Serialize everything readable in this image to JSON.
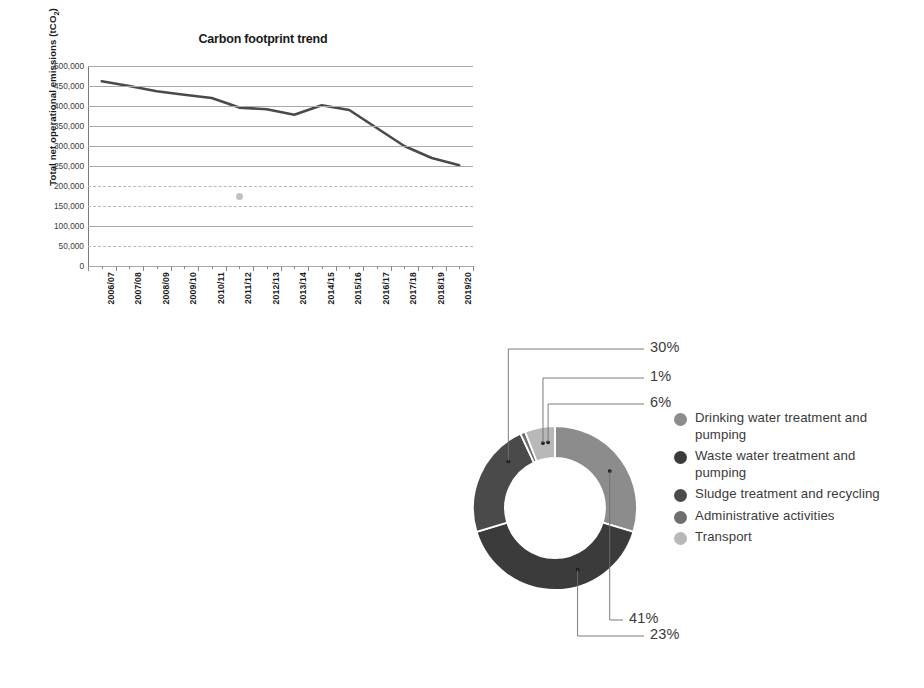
{
  "chart_data": [
    {
      "type": "line",
      "title": "Carbon footprint trend",
      "xlabel": "",
      "ylabel": "Total net operational emissions (tCO2)",
      "ylabel_main": "Total  net operational  emissions (tCO",
      "ylabel_sub": "2",
      "ylabel_tail": ")",
      "categories": [
        "2006/07",
        "2007/08",
        "2008/09",
        "2009/10",
        "2010/11",
        "2011/12",
        "2012/13",
        "2013/14",
        "2014/15",
        "2015/16",
        "2016/17",
        "2017/18",
        "2018/19",
        "2019/20"
      ],
      "values": [
        462000,
        450000,
        437000,
        428000,
        420000,
        396000,
        392000,
        378000,
        402000,
        390000,
        345000,
        300000,
        270000,
        252000
      ],
      "ylim": [
        0,
        500000
      ],
      "ytick_values": [
        500000,
        450000,
        400000,
        350000,
        300000,
        250000,
        200000,
        150000,
        100000,
        50000,
        0
      ],
      "ytick_labels": [
        "500,000",
        "450,000",
        "400,000",
        "350,000",
        "300,000",
        "250,000",
        "200,000",
        "150,000",
        "100,000",
        "50,000",
        "0"
      ],
      "grid": true,
      "legend": "none",
      "series_color": "#4a4a4a",
      "annotation": "small gray smudge artifact near 2011/12 at about 175,000"
    },
    {
      "type": "pie",
      "variant": "donut",
      "title": "",
      "labels": [
        "Drinking water treatment and pumping",
        "Waste water treatment and pumping",
        "Sludge treatment and recycling",
        "Administrative activities",
        "Transport"
      ],
      "values": [
        30,
        41,
        23,
        1,
        6
      ],
      "value_labels": [
        "30%",
        "41%",
        "23%",
        "1%",
        "6%"
      ],
      "colors": [
        "#8c8c8c",
        "#3b3b3b",
        "#4a4a4a",
        "#6e6e6e",
        "#b8b8b8"
      ],
      "legend": "right",
      "callout_order": [
        "30%",
        "1%",
        "6%",
        "23%",
        "41%"
      ]
    }
  ],
  "line_chart": {
    "title": "Carbon footprint trend",
    "y_axis_label_main": "Total  net operational  emissions (tCO",
    "y_axis_label_sub": "2",
    "y_axis_label_tail": ")"
  },
  "donut": {
    "callouts": [
      {
        "text": "30%"
      },
      {
        "text": "1%"
      },
      {
        "text": "6%"
      },
      {
        "text": "23%"
      },
      {
        "text": "41%"
      }
    ]
  },
  "legend": {
    "items": [
      {
        "label": "Drinking water treatment and pumping",
        "color": "#8c8c8c"
      },
      {
        "label": "Waste water treatment and pumping",
        "color": "#3b3b3b"
      },
      {
        "label": "Sludge treatment and recycling",
        "color": "#4a4a4a"
      },
      {
        "label": "Administrative activities",
        "color": "#6e6e6e"
      },
      {
        "label": "Transport",
        "color": "#b8b8b8"
      }
    ]
  }
}
